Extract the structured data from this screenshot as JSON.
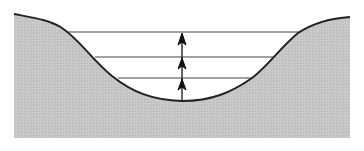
{
  "diagram": {
    "colors": {
      "background": "#ffffff",
      "ground_fill": "#c8c8c8",
      "outline": "#222222",
      "water_line": "#444444",
      "arrow": "#111111"
    },
    "water_levels": [
      {
        "y": 32,
        "x1": 68,
        "x2": 300
      },
      {
        "y": 57,
        "x1": 95,
        "x2": 273
      },
      {
        "y": 78,
        "x1": 118,
        "x2": 252
      }
    ],
    "arrows": [
      {
        "x": 182,
        "y_from": 101,
        "y_to": 78
      },
      {
        "x": 182,
        "y_from": 78,
        "y_to": 57
      },
      {
        "x": 182,
        "y_from": 57,
        "y_to": 32
      }
    ]
  }
}
